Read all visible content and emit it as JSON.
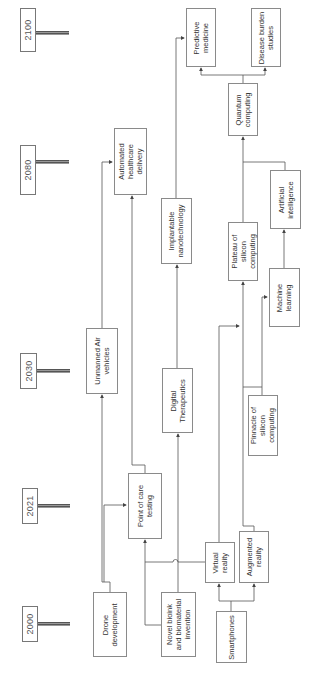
{
  "timeline": {
    "years": [
      {
        "label": "2100"
      },
      {
        "label": "2080"
      },
      {
        "label": "2030"
      },
      {
        "label": "2021"
      },
      {
        "label": "2000"
      }
    ]
  },
  "nodes": {
    "predictive_medicine": "Predictive\nmedicine",
    "disease_burden": "Disease burden\nstudies",
    "quantum_computing": "Quantum\ncomputing",
    "automated_healthcare": "Automated\nhealthcare\ndelivery",
    "artificial_intelligence": "Artificial\nintelligence",
    "implantable_nano": "Implantable\nnanotechnology",
    "plateau_silicon": "Plateau of\nsilicon\ncomputing",
    "machine_learning": "Machine\nlearning",
    "unmanned_air": "Unmanned Air\nvehicles",
    "digital_therapeutics": "Digital\nTherapeutics",
    "pinnacle_silicon": "Pinnacle of\nsilicon\ncomputing",
    "point_of_care": "Point of care\ntesting",
    "virtual_reality": "Virtual\nreality",
    "augmented_reality": "Augmented\nreality",
    "drone_development": "Drone\ndevelopment",
    "novel_bioink": "Novel bioink\nand biomaterial\ninvention",
    "smartphones": "Smartphones"
  },
  "colors": {
    "line": "#555555",
    "box_border": "#8a8a8a"
  }
}
